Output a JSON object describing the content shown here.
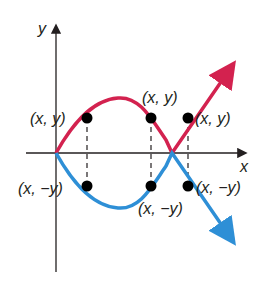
{
  "diagram": {
    "type": "reflection-about-x-axis",
    "axes": {
      "x_label": "x",
      "y_label": "y"
    },
    "curves": [
      {
        "name": "original",
        "color": "#d3224f"
      },
      {
        "name": "reflected",
        "color": "#2e8fd6"
      }
    ],
    "points_top": [
      {
        "label": "(x, y)"
      },
      {
        "label": "(x, y)"
      },
      {
        "label": "(x, y)"
      }
    ],
    "points_bottom": [
      {
        "label": "(x, −y)"
      },
      {
        "label": "(x, −y)"
      },
      {
        "label": "(x, −y)"
      }
    ],
    "colors": {
      "axis": "#231f20",
      "point": "#000000"
    }
  }
}
